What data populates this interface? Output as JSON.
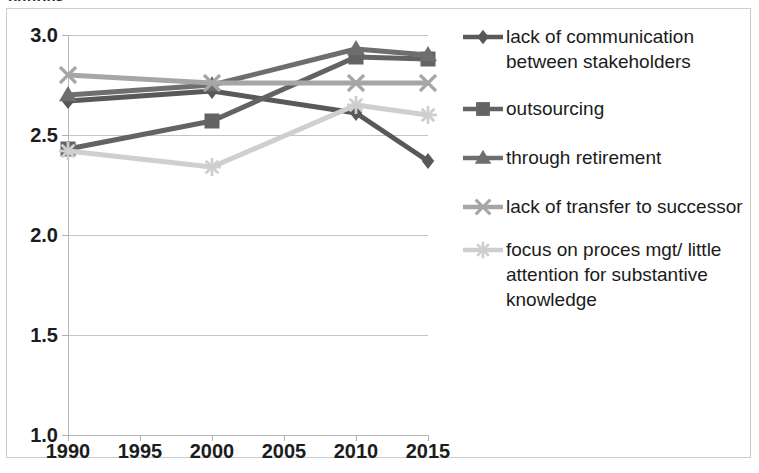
{
  "cut_off_text": "buttons.",
  "chart_data": {
    "type": "line",
    "title": "",
    "xlabel": "",
    "ylabel": "",
    "x": [
      1990,
      2000,
      2010,
      2015
    ],
    "x_tick_labels": [
      "1990",
      "1995",
      "2000",
      "2005",
      "2010",
      "2015"
    ],
    "x_tick_values": [
      1990,
      1995,
      2000,
      2005,
      2010,
      2015
    ],
    "y_tick_labels": [
      "1.0",
      "1.5",
      "2.0",
      "2.5",
      "3.0"
    ],
    "y_tick_values": [
      1.0,
      1.5,
      2.0,
      2.5,
      3.0
    ],
    "xlim": [
      1990,
      2015
    ],
    "ylim": [
      1.0,
      3.0
    ],
    "grid": "horizontal",
    "legend_position": "right",
    "series": [
      {
        "name": "lack of communication between stakeholders",
        "marker": "diamond",
        "color": "#595959",
        "values": [
          2.67,
          2.72,
          2.61,
          2.37
        ]
      },
      {
        "name": "outsourcing",
        "marker": "square",
        "color": "#636363",
        "values": [
          2.43,
          2.57,
          2.89,
          2.88
        ]
      },
      {
        "name": "through retirement",
        "marker": "triangle",
        "color": "#6e6e6e",
        "values": [
          2.7,
          2.75,
          2.93,
          2.9
        ]
      },
      {
        "name": "lack of transfer to successor",
        "marker": "x-cross",
        "color": "#a6a6a6",
        "values": [
          2.8,
          2.76,
          2.76,
          2.76
        ]
      },
      {
        "name": "focus on proces mgt/ little attention for substantive knowledge",
        "marker": "asterisk",
        "color": "#cfcfcf",
        "values": [
          2.42,
          2.34,
          2.65,
          2.6
        ]
      }
    ]
  },
  "legend": {
    "items": [
      {
        "label": "lack of communication between stakeholders",
        "marker": "diamond-marker-icon",
        "color": "#595959"
      },
      {
        "label": "outsourcing",
        "marker": "square-marker-icon",
        "color": "#636363"
      },
      {
        "label": "through retirement",
        "marker": "triangle-marker-icon",
        "color": "#6e6e6e"
      },
      {
        "label": "lack of transfer to successor",
        "marker": "x-marker-icon",
        "color": "#a6a6a6"
      },
      {
        "label": "focus on proces mgt/ little attention for substantive knowledge",
        "marker": "asterisk-marker-icon",
        "color": "#cfcfcf"
      }
    ]
  }
}
